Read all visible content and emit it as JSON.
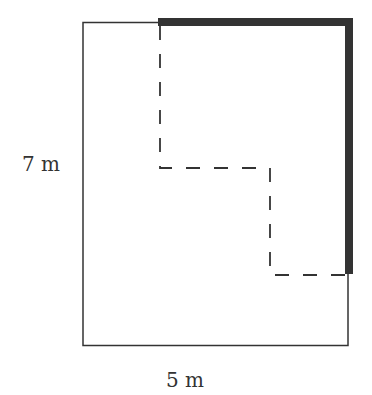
{
  "diagram": {
    "type": "floor-plan-path",
    "labels": {
      "height": "7 m",
      "width": "5 m"
    },
    "colors": {
      "outline": "#333333",
      "thick_path": "#333333",
      "dashed_path": "#333333",
      "background": "#ffffff"
    },
    "outer_rectangle": {
      "x": 83,
      "y": 22,
      "width": 265,
      "height": 323
    },
    "thick_path_points": "158,22 349,22 349,274",
    "dashed_path_points": "160,22 160,168 270,168 270,275 349,275"
  }
}
